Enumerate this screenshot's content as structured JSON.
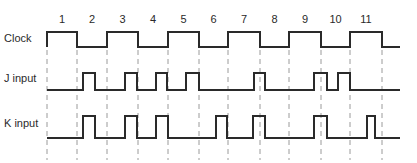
{
  "diagram": {
    "type": "timing-diagram",
    "colors": {
      "signal": "#2a2a2a",
      "gridline": "#9a9a9a",
      "background": "#ffffff"
    },
    "clock_numbers": [
      "1",
      "2",
      "3",
      "4",
      "5",
      "6",
      "7",
      "8",
      "9",
      "10",
      "11"
    ],
    "signals": [
      {
        "name": "Clock",
        "label": "Clock"
      },
      {
        "name": "J",
        "label": "J input"
      },
      {
        "name": "K",
        "label": "K input"
      }
    ]
  },
  "chart_data": {
    "type": "timing",
    "title": "",
    "clock_periods": 11,
    "period_labels": [
      "1",
      "2",
      "3",
      "4",
      "5",
      "6",
      "7",
      "8",
      "9",
      "10",
      "11"
    ],
    "gridlines_x": [
      47,
      77,
      107,
      138,
      168,
      199,
      228,
      260,
      289,
      321,
      350,
      382
    ],
    "series": [
      {
        "name": "Clock",
        "levels_per_half_period": [
          1,
          0,
          1,
          0,
          1,
          0,
          1,
          0,
          1,
          0,
          1,
          0
        ]
      },
      {
        "name": "J input",
        "pulses_x": [
          [
            83,
            95
          ],
          [
            125,
            137
          ],
          [
            156,
            167
          ],
          [
            186,
            199
          ],
          [
            254,
            265
          ],
          [
            314,
            327
          ],
          [
            338,
            350
          ]
        ]
      },
      {
        "name": "K input",
        "pulses_x": [
          [
            83,
            95
          ],
          [
            125,
            137
          ],
          [
            156,
            168
          ],
          [
            216,
            227
          ],
          [
            253,
            265
          ],
          [
            314,
            327
          ],
          [
            367,
            375
          ]
        ]
      }
    ]
  }
}
